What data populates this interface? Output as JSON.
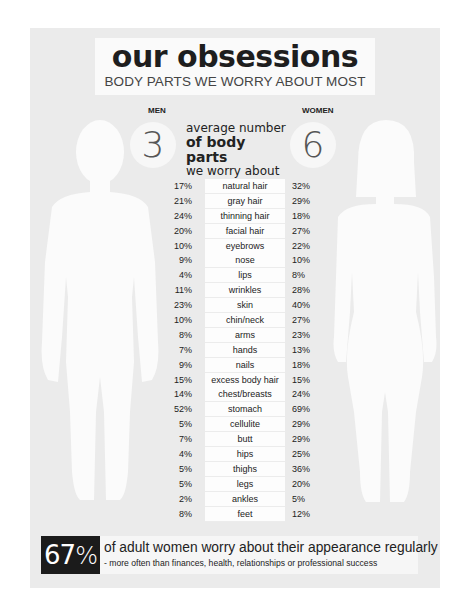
{
  "header": {
    "title": "our obsessions",
    "subtitle": "BODY PARTS WE WORRY ABOUT MOST"
  },
  "average": {
    "men_label": "MEN",
    "women_label": "WOMEN",
    "men_value": "3",
    "women_value": "6",
    "line1": "average number",
    "line2": "of body parts",
    "line3": "we worry about"
  },
  "rows": [
    {
      "part": "natural hair",
      "men": "17%",
      "women": "32%"
    },
    {
      "part": "gray hair",
      "men": "21%",
      "women": "29%"
    },
    {
      "part": "thinning hair",
      "men": "24%",
      "women": "18%"
    },
    {
      "part": "facial hair",
      "men": "20%",
      "women": "27%"
    },
    {
      "part": "eyebrows",
      "men": "10%",
      "women": "22%"
    },
    {
      "part": "nose",
      "men": "9%",
      "women": "10%"
    },
    {
      "part": "lips",
      "men": "4%",
      "women": "8%"
    },
    {
      "part": "wrinkles",
      "men": "11%",
      "women": "28%"
    },
    {
      "part": "skin",
      "men": "23%",
      "women": "40%"
    },
    {
      "part": "chin/neck",
      "men": "10%",
      "women": "27%"
    },
    {
      "part": "arms",
      "men": "8%",
      "women": "23%"
    },
    {
      "part": "hands",
      "men": "7%",
      "women": "13%"
    },
    {
      "part": "nails",
      "men": "9%",
      "women": "18%"
    },
    {
      "part": "excess body hair",
      "men": "15%",
      "women": "15%"
    },
    {
      "part": "chest/breasts",
      "men": "14%",
      "women": "24%"
    },
    {
      "part": "stomach",
      "men": "52%",
      "women": "69%"
    },
    {
      "part": "cellulite",
      "men": "5%",
      "women": "29%"
    },
    {
      "part": "butt",
      "men": "7%",
      "women": "29%"
    },
    {
      "part": "hips",
      "men": "4%",
      "women": "25%"
    },
    {
      "part": "thighs",
      "men": "5%",
      "women": "36%"
    },
    {
      "part": "legs",
      "men": "5%",
      "women": "20%"
    },
    {
      "part": "ankles",
      "men": "2%",
      "women": "5%"
    },
    {
      "part": "feet",
      "men": "8%",
      "women": "12%"
    }
  ],
  "footer": {
    "stat_number": "67",
    "stat_pct": "%",
    "main_text": "of adult women worry about their appearance regularly",
    "sub_text": "- more often than finances, health, relationships or professional success"
  },
  "chart_data": {
    "type": "table",
    "title": "our obsessions",
    "subtitle": "BODY PARTS WE WORRY ABOUT MOST",
    "columns": [
      "MEN",
      "body part",
      "WOMEN"
    ],
    "average_body_parts": {
      "men": 3,
      "women": 6
    },
    "categories": [
      "natural hair",
      "gray hair",
      "thinning hair",
      "facial hair",
      "eyebrows",
      "nose",
      "lips",
      "wrinkles",
      "skin",
      "chin/neck",
      "arms",
      "hands",
      "nails",
      "excess body hair",
      "chest/breasts",
      "stomach",
      "cellulite",
      "butt",
      "hips",
      "thighs",
      "legs",
      "ankles",
      "feet"
    ],
    "series": [
      {
        "name": "MEN",
        "values": [
          17,
          21,
          24,
          20,
          10,
          9,
          4,
          11,
          23,
          10,
          8,
          7,
          9,
          15,
          14,
          52,
          5,
          7,
          4,
          5,
          5,
          2,
          8
        ]
      },
      {
        "name": "WOMEN",
        "values": [
          32,
          29,
          18,
          27,
          22,
          10,
          8,
          28,
          40,
          27,
          23,
          13,
          18,
          15,
          24,
          69,
          29,
          29,
          25,
          36,
          20,
          5,
          12
        ]
      }
    ],
    "unit": "%",
    "annotation": "67% of adult women worry about their appearance regularly - more often than finances, health, relationships or professional success"
  }
}
